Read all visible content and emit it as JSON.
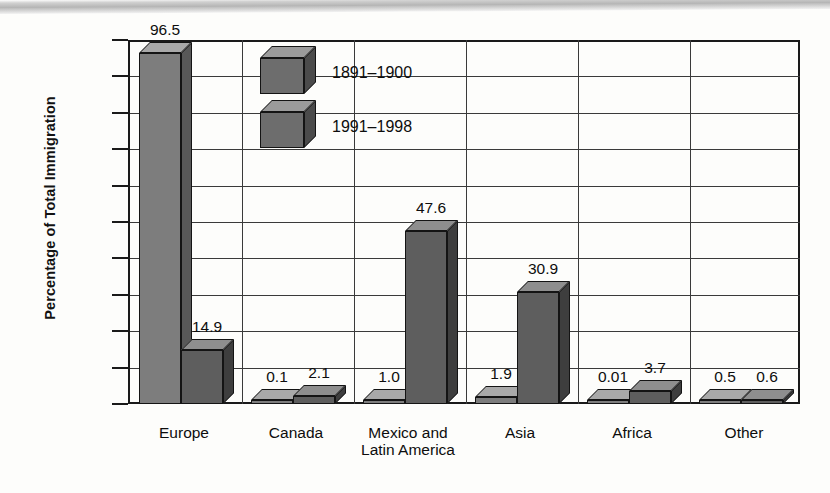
{
  "chart_data": {
    "type": "bar",
    "title": "",
    "xlabel": "",
    "ylabel": "Percentage of Total Immigration",
    "ylim": [
      0,
      100
    ],
    "yticks": [
      0,
      10,
      20,
      30,
      40,
      50,
      60,
      70,
      80,
      90,
      100
    ],
    "ytick_labels": [
      "0",
      "10",
      "20",
      "30",
      "40",
      "50",
      "60",
      "70",
      "80",
      "90",
      "100"
    ],
    "grid": true,
    "legend_position": "inside-top-center",
    "categories": [
      "Europe",
      "Canada",
      "Mexico and Latin America",
      "Asia",
      "Africa",
      "Other"
    ],
    "category_label_lines": [
      [
        "Europe"
      ],
      [
        "Canada"
      ],
      [
        "Mexico and",
        "Latin America"
      ],
      [
        "Asia"
      ],
      [
        "Africa"
      ],
      [
        "Other"
      ]
    ],
    "series": [
      {
        "name": "1891–1900",
        "values": [
          96.5,
          0.1,
          1.0,
          1.9,
          0.01,
          0.5
        ],
        "value_labels": [
          "96.5",
          "0.1",
          "1.0",
          "1.9",
          "0.01",
          "0.5"
        ],
        "color": "#7d7d7d"
      },
      {
        "name": "1991–1998",
        "values": [
          14.9,
          2.1,
          47.6,
          30.9,
          3.7,
          0.6
        ],
        "value_labels": [
          "14.9",
          "2.1",
          "47.6",
          "30.9",
          "3.7",
          "0.6"
        ],
        "color": "#5e5e5e"
      }
    ]
  },
  "legend": {
    "items": [
      {
        "label": "1891–1900"
      },
      {
        "label": "1991–1998"
      }
    ]
  },
  "colors": {
    "bar_front": "#6d6d6d",
    "bar_top": "#9b9b9b",
    "bar_side": "#4b4b4b",
    "axis": "#1a1a1a",
    "grid": "#3a3a3a",
    "background": "#fdfdfb",
    "text": "#0d0d0d"
  }
}
